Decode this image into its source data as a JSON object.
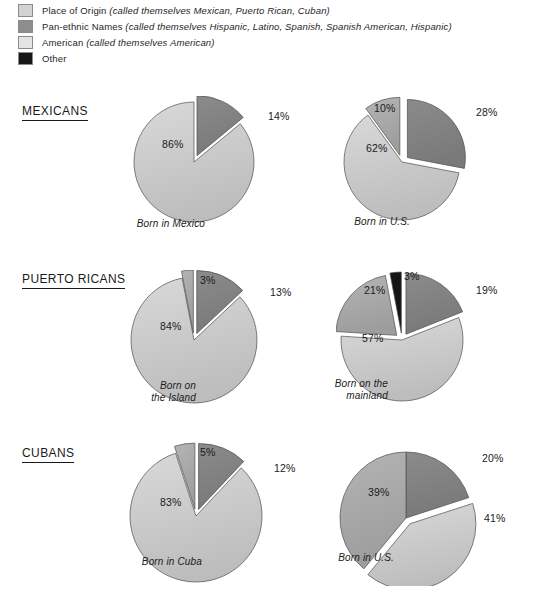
{
  "legend": {
    "items": [
      {
        "label": "Place of Origin",
        "note": "(called themselves Mexican, Puerto Rican, Cuban)",
        "color": "#d2d2d2",
        "key": "origin"
      },
      {
        "label": "Pan-ethnic Names",
        "note": "(called themselves Hispanic, Latino, Spanish, Spanish American, Hispanic)",
        "color": "#8d8d8d",
        "key": "panethnic"
      },
      {
        "label": "American",
        "note": "(called themselves American)",
        "color": "#e4e4e4",
        "key": "american"
      },
      {
        "label": "Other",
        "note": "",
        "color": "#161616",
        "key": "other"
      }
    ]
  },
  "palette": {
    "origin": "#d9d9d9",
    "panethnic": "#8b8b8b",
    "american": "#b4b4b4",
    "other": "#141414",
    "outline": "#4d4d4d",
    "text": "#1a1a1a"
  },
  "chart_data": {
    "type": "pie",
    "title": "",
    "legend_position": "top",
    "categories": [
      "Place of Origin",
      "Pan-ethnic Names",
      "American",
      "Other"
    ],
    "groups": [
      {
        "name": "MEXICANS",
        "charts": [
          {
            "caption": "Born in Mexico",
            "slices": [
              {
                "label": "14%",
                "value": 14,
                "category": "Pan-ethnic Names",
                "key": "panethnic",
                "exploded": true
              },
              {
                "label": "86%",
                "value": 86,
                "category": "Place of Origin",
                "key": "origin",
                "exploded": false
              }
            ]
          },
          {
            "caption": "Born in U.S.",
            "slices": [
              {
                "label": "28%",
                "value": 28,
                "category": "Pan-ethnic Names",
                "key": "panethnic",
                "exploded": true
              },
              {
                "label": "62%",
                "value": 62,
                "category": "Place of Origin",
                "key": "origin",
                "exploded": false
              },
              {
                "label": "10%",
                "value": 10,
                "category": "American",
                "key": "american",
                "exploded": true
              }
            ]
          }
        ]
      },
      {
        "name": "PUERTO RICANS",
        "charts": [
          {
            "caption": "Born on\nthe Island",
            "slices": [
              {
                "label": "13%",
                "value": 13,
                "category": "Pan-ethnic Names",
                "key": "panethnic",
                "exploded": true
              },
              {
                "label": "84%",
                "value": 84,
                "category": "Place of Origin",
                "key": "origin",
                "exploded": false
              },
              {
                "label": "3%",
                "value": 3,
                "category": "American",
                "key": "american",
                "exploded": true
              }
            ]
          },
          {
            "caption": "Born on the\nmainland",
            "slices": [
              {
                "label": "19%",
                "value": 19,
                "category": "Pan-ethnic Names",
                "key": "panethnic",
                "exploded": true
              },
              {
                "label": "57%",
                "value": 57,
                "category": "Place of Origin",
                "key": "origin",
                "exploded": false
              },
              {
                "label": "21%",
                "value": 21,
                "category": "American",
                "key": "american",
                "exploded": true
              },
              {
                "label": "3%",
                "value": 3,
                "category": "Other",
                "key": "other",
                "exploded": true
              }
            ]
          }
        ]
      },
      {
        "name": "CUBANS",
        "charts": [
          {
            "caption": "Born in Cuba",
            "slices": [
              {
                "label": "12%",
                "value": 12,
                "category": "Pan-ethnic Names",
                "key": "panethnic",
                "exploded": true
              },
              {
                "label": "83%",
                "value": 83,
                "category": "Place of Origin",
                "key": "origin",
                "exploded": false
              },
              {
                "label": "5%",
                "value": 5,
                "category": "American",
                "key": "american",
                "exploded": true
              }
            ]
          },
          {
            "caption": "Born in U.S.",
            "slices": [
              {
                "label": "20%",
                "value": 20,
                "category": "Pan-ethnic Names",
                "key": "panethnic",
                "exploded": false
              },
              {
                "label": "41%",
                "value": 41,
                "category": "Place of Origin",
                "key": "origin",
                "exploded": true
              },
              {
                "label": "39%",
                "value": 39,
                "category": "American",
                "key": "american",
                "exploded": false
              }
            ]
          }
        ]
      }
    ]
  }
}
